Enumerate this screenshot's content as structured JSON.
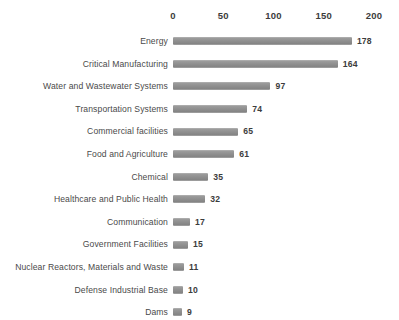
{
  "chart_data": {
    "type": "bar",
    "orientation": "horizontal",
    "title": "",
    "subtitle": "",
    "xlabel": "",
    "ylabel": "",
    "xlim": [
      0,
      200
    ],
    "grid": false,
    "legend": null,
    "axis_ticks": [
      "0",
      "50",
      "100",
      "150",
      "200"
    ],
    "axis_tick_values": [
      0,
      50,
      100,
      150,
      200
    ],
    "categories": [
      "Energy",
      "Critical Manufacturing",
      "Water and Wastewater Systems",
      "Transportation Systems",
      "Commercial facilities",
      "Food and Agriculture",
      "Chemical",
      "Healthcare and Public Health",
      "Communication",
      "Government Facilities",
      "Nuclear Reactors, Materials and Waste",
      "Defense Industrial Base",
      "Dams"
    ],
    "values": [
      178,
      164,
      97,
      74,
      65,
      61,
      35,
      32,
      17,
      15,
      11,
      10,
      9
    ],
    "value_labels": [
      "178",
      "164",
      "97",
      "74",
      "65",
      "61",
      "35",
      "32",
      "17",
      "15",
      "11",
      "10",
      "9"
    ],
    "colors": {
      "bar": "#8f8f8f",
      "bar_highlight": "#b4b4b4",
      "bar_shadow": "#858585",
      "category_text": "#4a4a4a",
      "value_text": "#3c3c3c",
      "axis_text": "#3c3c3c",
      "background": "#ffffff"
    }
  }
}
